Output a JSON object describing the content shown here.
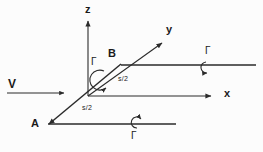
{
  "figure": {
    "type": "vector-diagram",
    "background_color": "#fcfcfc",
    "stroke_color": "#2b2b2b",
    "width": 263,
    "height": 152
  },
  "axes": {
    "z": {
      "label": "z",
      "x": 85,
      "y": 4
    },
    "y": {
      "label": "y",
      "x": 166,
      "y": 24
    },
    "x": {
      "label": "x",
      "x": 224,
      "y": 88
    }
  },
  "points": {
    "a": {
      "label": "A",
      "x": 31,
      "y": 118
    },
    "b": {
      "label": "B",
      "x": 108,
      "y": 48
    }
  },
  "velocity": {
    "label": "V",
    "x": 8,
    "y": 78
  },
  "segments": [
    {
      "label": "s/2",
      "x": 118,
      "y": 75
    },
    {
      "label": "s/2",
      "x": 82,
      "y": 104
    }
  ],
  "circulations": [
    {
      "label": "Γ",
      "x": 91,
      "y": 57,
      "name": "gamma-origin"
    },
    {
      "label": "Γ",
      "x": 205,
      "y": 46,
      "name": "gamma-right"
    },
    {
      "label": "Γ",
      "x": 131,
      "y": 131,
      "name": "gamma-bottom"
    }
  ]
}
